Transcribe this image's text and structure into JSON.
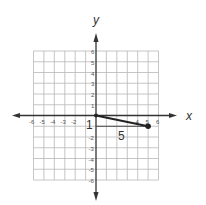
{
  "diagram": {
    "type": "coordinate-plane",
    "axes": {
      "x_label": "x",
      "y_label": "y",
      "range": [
        -6,
        6
      ],
      "x_ticks_visible": [
        "-6",
        "-5",
        "-4",
        "-3",
        "-2",
        "4",
        "5",
        "6"
      ],
      "y_ticks_visible": [
        "6",
        "5",
        "4",
        "3",
        "2",
        "1",
        "-2",
        "-3",
        "-4",
        "-5",
        "-6"
      ]
    },
    "segment": {
      "from": [
        0,
        0
      ],
      "to": [
        5,
        -1
      ],
      "endpoint_marker": "dot"
    },
    "slope_triangle": {
      "run_label": "5",
      "rise_label": "1"
    },
    "colors": {
      "grid": "#b8b8b8",
      "axis": "#333333",
      "segment": "#222222",
      "background": "#ffffff"
    }
  }
}
